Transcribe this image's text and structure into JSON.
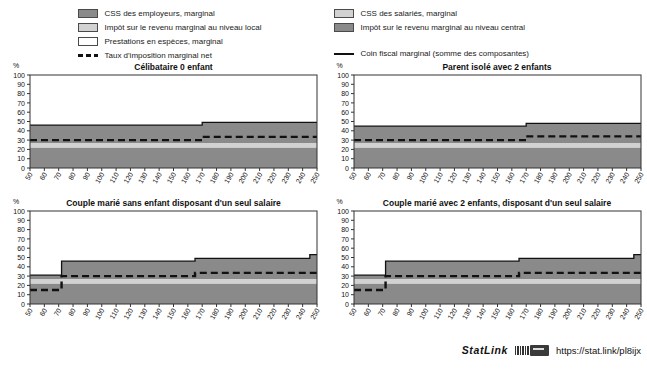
{
  "legend": {
    "left_items": [
      {
        "label": "CSS des employeurs, marginal",
        "color": "#8a8a8a",
        "type": "swatch"
      },
      {
        "label": "Impôt sur le revenu marginal au niveau local",
        "color": "#d2d2d2",
        "type": "swatch"
      },
      {
        "label": "Prestations en espèces, marginal",
        "color": "#ffffff",
        "type": "swatch"
      },
      {
        "label": "Taux d'imposition marginal net",
        "color": "#111111",
        "type": "dashed-line"
      }
    ],
    "right_items": [
      {
        "label": "CSS des salariés, marginal",
        "color": "#d2d2d2",
        "type": "swatch"
      },
      {
        "label": "Impôt sur le revenu marginal au niveau central",
        "color": "#8a8a8a",
        "type": "swatch"
      },
      {
        "label": "Coin fiscal marginal (somme des composantes)",
        "color": "#111111",
        "type": "solid-line"
      }
    ]
  },
  "footer": {
    "statlink_word": "StatLink",
    "statlink_icon": "barcode-icon",
    "url": "https://stat.link/pl8ijx"
  },
  "colors": {
    "employer_ssc": "#8a8a8a",
    "employee_ssc": "#d2d2d2",
    "income_tax_central": "#8a8a8a",
    "income_tax_local": "#d2d2d2",
    "cash_benefits": "#ffffff",
    "net_marginal_line": "#111111",
    "tax_wedge_line": "#111111",
    "axis": "#333333",
    "plot_background": "#ffffff"
  },
  "chart_data": [
    {
      "type": "area",
      "id": "celibataire-0-enfant",
      "title": "Célibataire 0 enfant",
      "xlabel": "",
      "ylabel": "%",
      "ylim": [
        0,
        100
      ],
      "xlim": [
        50,
        250
      ],
      "yticks": [
        0,
        10,
        20,
        30,
        40,
        50,
        60,
        70,
        80,
        90,
        100
      ],
      "xticks": [
        50,
        60,
        70,
        80,
        90,
        100,
        110,
        120,
        130,
        140,
        150,
        160,
        170,
        180,
        190,
        200,
        210,
        220,
        230,
        240,
        250
      ],
      "grid": false,
      "legend_position": "top-shared",
      "x": [
        50,
        60,
        70,
        80,
        90,
        100,
        110,
        120,
        130,
        140,
        150,
        160,
        165,
        170,
        180,
        190,
        200,
        210,
        220,
        230,
        240,
        250
      ],
      "series": [
        {
          "name": "CSS des salariés, marginal",
          "stack": true,
          "values": [
            22,
            22,
            22,
            22,
            22,
            22,
            22,
            22,
            22,
            22,
            22,
            22,
            22,
            22,
            22,
            22,
            22,
            22,
            22,
            22,
            22,
            22
          ]
        },
        {
          "name": "Impôt sur le revenu marginal au niveau central",
          "stack": true,
          "values": [
            0,
            0,
            0,
            0,
            0,
            0,
            0,
            0,
            0,
            0,
            0,
            0,
            0,
            0,
            0,
            0,
            0,
            0,
            0,
            0,
            0,
            0
          ]
        },
        {
          "name": "Impôt sur le revenu marginal au niveau local",
          "stack": true,
          "values": [
            5,
            5,
            5,
            5,
            5,
            5,
            5,
            5,
            5,
            5,
            5,
            5,
            5,
            5,
            5,
            5,
            5,
            5,
            5,
            5,
            5,
            5
          ]
        },
        {
          "name": "CSS des employeurs, marginal",
          "stack": true,
          "values": [
            19,
            19,
            19,
            19,
            19,
            19,
            19,
            19,
            19,
            19,
            19,
            19,
            19,
            22,
            22,
            22,
            22,
            22,
            22,
            22,
            22,
            22
          ]
        },
        {
          "name": "Taux d'imposition marginal net",
          "stack": false,
          "style": "dashed",
          "values": [
            30,
            30,
            30,
            30,
            30,
            30,
            30,
            30,
            30,
            30,
            30,
            30,
            30,
            33.5,
            33.5,
            33.5,
            33.5,
            33.5,
            33.5,
            33.5,
            33.5,
            33.5
          ]
        },
        {
          "name": "Coin fiscal marginal (somme des composantes)",
          "stack": false,
          "style": "solid",
          "values": [
            46,
            46,
            46,
            46,
            46,
            46,
            46,
            46,
            46,
            46,
            46,
            46,
            46,
            49,
            49,
            49,
            49,
            49,
            49,
            49,
            49,
            49
          ]
        }
      ]
    },
    {
      "type": "area",
      "id": "parent-isole-2-enfants",
      "title": "Parent isolé avec 2 enfants",
      "xlabel": "",
      "ylabel": "%",
      "ylim": [
        0,
        100
      ],
      "xlim": [
        50,
        250
      ],
      "yticks": [
        0,
        10,
        20,
        30,
        40,
        50,
        60,
        70,
        80,
        90,
        100
      ],
      "xticks": [
        50,
        60,
        70,
        80,
        90,
        100,
        110,
        120,
        130,
        140,
        150,
        160,
        170,
        180,
        190,
        200,
        210,
        220,
        230,
        240,
        250
      ],
      "grid": false,
      "legend_position": "top-shared",
      "x": [
        50,
        60,
        70,
        80,
        90,
        100,
        110,
        120,
        130,
        140,
        150,
        160,
        165,
        170,
        180,
        190,
        200,
        210,
        220,
        230,
        240,
        250
      ],
      "series": [
        {
          "name": "CSS des salariés, marginal",
          "stack": true,
          "values": [
            22,
            22,
            22,
            22,
            22,
            22,
            22,
            22,
            22,
            22,
            22,
            22,
            22,
            22,
            22,
            22,
            22,
            22,
            22,
            22,
            22,
            22
          ]
        },
        {
          "name": "Impôt sur le revenu marginal au niveau central",
          "stack": true,
          "values": [
            0,
            0,
            0,
            0,
            0,
            0,
            0,
            0,
            0,
            0,
            0,
            0,
            0,
            0,
            0,
            0,
            0,
            0,
            0,
            0,
            0,
            0
          ]
        },
        {
          "name": "Impôt sur le revenu marginal au niveau local",
          "stack": true,
          "values": [
            5,
            5,
            5,
            5,
            5,
            5,
            5,
            5,
            5,
            5,
            5,
            5,
            5,
            5,
            5,
            5,
            5,
            5,
            5,
            5,
            5,
            5
          ]
        },
        {
          "name": "CSS des employeurs, marginal",
          "stack": true,
          "values": [
            18,
            18,
            18,
            18,
            18,
            18,
            18,
            18,
            18,
            18,
            18,
            18,
            18,
            21,
            21,
            21,
            21,
            21,
            21,
            21,
            21,
            21
          ]
        },
        {
          "name": "Taux d'imposition marginal net",
          "stack": false,
          "style": "dashed",
          "values": [
            30,
            30,
            30,
            30,
            30,
            30,
            30,
            30,
            30,
            30,
            30,
            30,
            30,
            34,
            34,
            34,
            34,
            34,
            34,
            34,
            34,
            34
          ]
        },
        {
          "name": "Coin fiscal marginal (somme des composantes)",
          "stack": false,
          "style": "solid",
          "values": [
            45,
            45,
            45,
            45,
            45,
            45,
            45,
            45,
            45,
            45,
            45,
            45,
            45,
            48,
            48,
            48,
            48,
            48,
            48,
            48,
            48,
            48
          ]
        }
      ]
    },
    {
      "type": "area",
      "id": "couple-marie-sans-enfant",
      "title": "Couple marié sans enfant disposant d'un seul salaire",
      "xlabel": "",
      "ylabel": "%",
      "ylim": [
        0,
        100
      ],
      "xlim": [
        50,
        250
      ],
      "yticks": [
        0,
        10,
        20,
        30,
        40,
        50,
        60,
        70,
        80,
        90,
        100
      ],
      "xticks": [
        50,
        60,
        70,
        80,
        90,
        100,
        110,
        120,
        130,
        140,
        150,
        160,
        170,
        180,
        190,
        200,
        210,
        220,
        230,
        240,
        250
      ],
      "grid": false,
      "legend_position": "top-shared",
      "x": [
        50,
        60,
        70,
        72,
        80,
        90,
        100,
        110,
        120,
        130,
        140,
        150,
        160,
        165,
        170,
        180,
        190,
        200,
        210,
        240,
        245,
        250
      ],
      "series": [
        {
          "name": "CSS des salariés, marginal",
          "stack": true,
          "values": [
            22,
            22,
            22,
            22,
            22,
            22,
            22,
            22,
            22,
            22,
            22,
            22,
            22,
            22,
            22,
            22,
            22,
            22,
            22,
            22,
            22,
            22
          ]
        },
        {
          "name": "Impôt sur le revenu marginal au niveau central",
          "stack": true,
          "values": [
            0,
            0,
            0,
            0,
            0,
            0,
            0,
            0,
            0,
            0,
            0,
            0,
            0,
            0,
            0,
            0,
            0,
            0,
            0,
            0,
            0,
            0
          ]
        },
        {
          "name": "Impôt sur le revenu marginal au niveau local",
          "stack": true,
          "values": [
            5,
            5,
            5,
            5,
            5,
            5,
            5,
            5,
            5,
            5,
            5,
            5,
            5,
            5,
            5,
            5,
            5,
            5,
            5,
            5,
            5,
            5
          ]
        },
        {
          "name": "CSS des employeurs, marginal",
          "stack": true,
          "values": [
            4,
            4,
            4,
            19,
            19,
            19,
            19,
            19,
            19,
            19,
            19,
            19,
            19,
            22,
            22,
            22,
            22,
            22,
            22,
            22,
            26,
            26
          ]
        },
        {
          "name": "Taux d'imposition marginal net",
          "stack": false,
          "style": "dashed",
          "values": [
            15,
            15,
            15,
            30,
            30,
            30,
            30,
            30,
            30,
            30,
            30,
            30,
            30,
            33.5,
            33.5,
            33.5,
            33.5,
            33.5,
            33.5,
            33.5,
            33.5,
            33.5
          ]
        },
        {
          "name": "Coin fiscal marginal (somme des composantes)",
          "stack": false,
          "style": "solid",
          "values": [
            31,
            31,
            31,
            46,
            46,
            46,
            46,
            46,
            46,
            46,
            46,
            46,
            46,
            49,
            49,
            49,
            49,
            49,
            49,
            49,
            53,
            53
          ]
        }
      ]
    },
    {
      "type": "area",
      "id": "couple-marie-2-enfants",
      "title": "Couple marié avec 2 enfants, disposant d'un seul salaire",
      "xlabel": "",
      "ylabel": "%",
      "ylim": [
        0,
        100
      ],
      "xlim": [
        50,
        250
      ],
      "yticks": [
        0,
        10,
        20,
        30,
        40,
        50,
        60,
        70,
        80,
        90,
        100
      ],
      "xticks": [
        50,
        60,
        70,
        80,
        90,
        100,
        110,
        120,
        130,
        140,
        150,
        160,
        170,
        180,
        190,
        200,
        210,
        220,
        230,
        240,
        250
      ],
      "grid": false,
      "legend_position": "top-shared",
      "x": [
        50,
        60,
        70,
        72,
        80,
        90,
        100,
        110,
        120,
        130,
        140,
        150,
        160,
        165,
        170,
        180,
        190,
        200,
        210,
        240,
        245,
        250
      ],
      "series": [
        {
          "name": "CSS des salariés, marginal",
          "stack": true,
          "values": [
            22,
            22,
            22,
            22,
            22,
            22,
            22,
            22,
            22,
            22,
            22,
            22,
            22,
            22,
            22,
            22,
            22,
            22,
            22,
            22,
            22,
            22
          ]
        },
        {
          "name": "Impôt sur le revenu marginal au niveau central",
          "stack": true,
          "values": [
            0,
            0,
            0,
            0,
            0,
            0,
            0,
            0,
            0,
            0,
            0,
            0,
            0,
            0,
            0,
            0,
            0,
            0,
            0,
            0,
            0,
            0
          ]
        },
        {
          "name": "Impôt sur le revenu marginal au niveau local",
          "stack": true,
          "values": [
            5,
            5,
            5,
            5,
            5,
            5,
            5,
            5,
            5,
            5,
            5,
            5,
            5,
            5,
            5,
            5,
            5,
            5,
            5,
            5,
            5,
            5
          ]
        },
        {
          "name": "CSS des employeurs, marginal",
          "stack": true,
          "values": [
            4,
            4,
            4,
            19,
            19,
            19,
            19,
            19,
            19,
            19,
            19,
            19,
            19,
            22,
            22,
            22,
            22,
            22,
            22,
            22,
            26,
            26
          ]
        },
        {
          "name": "Taux d'imposition marginal net",
          "stack": false,
          "style": "dashed",
          "values": [
            15,
            15,
            15,
            30,
            30,
            30,
            30,
            30,
            30,
            30,
            30,
            30,
            30,
            33.5,
            33.5,
            33.5,
            33.5,
            33.5,
            33.5,
            33.5,
            33.5,
            33.5
          ]
        },
        {
          "name": "Coin fiscal marginal (somme des composantes)",
          "stack": false,
          "style": "solid",
          "values": [
            31,
            31,
            31,
            46,
            46,
            46,
            46,
            46,
            46,
            46,
            46,
            46,
            46,
            49,
            49,
            49,
            49,
            49,
            49,
            49,
            53,
            53
          ]
        }
      ]
    }
  ]
}
